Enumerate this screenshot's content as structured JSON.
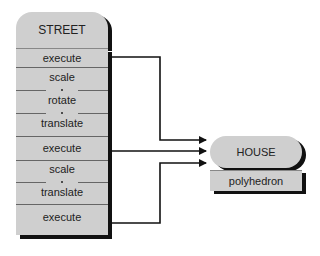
{
  "street": {
    "title": "STREET",
    "fields": [
      {
        "label": "execute"
      },
      {
        "label": "scale"
      },
      {
        "label": "rotate"
      },
      {
        "label": "translate"
      },
      {
        "label": "execute"
      },
      {
        "label": "scale"
      },
      {
        "label": "translate"
      },
      {
        "label": "execute"
      }
    ]
  },
  "house": {
    "title": "HOUSE",
    "field": "polyhedron"
  },
  "colors": {
    "node_fill": "#cfcfcf",
    "shadow": "#111111",
    "line": "#111111"
  }
}
